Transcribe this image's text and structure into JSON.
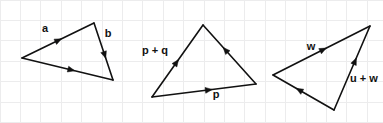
{
  "figure": {
    "width": 383,
    "height": 123,
    "background_color": "#ffffff",
    "grid": {
      "visible": true,
      "spacing": 20.4,
      "color": "#ececed",
      "line_width": 1,
      "origin_x": 0,
      "origin_y": 0
    },
    "stroke_color": "#111111",
    "stroke_width": 1.6,
    "arrow_size": 7
  },
  "diagrams": [
    {
      "id": "triangle-a-b",
      "name": "left-triangle",
      "vertices": [
        {
          "name": "left",
          "x": 22,
          "y": 58
        },
        {
          "name": "top",
          "x": 94,
          "y": 23
        },
        {
          "name": "right",
          "x": 113,
          "y": 80
        }
      ],
      "edges": [
        {
          "name": "edge-a",
          "from": {
            "x": 22,
            "y": 58
          },
          "to": {
            "x": 94,
            "y": 23
          },
          "arrow_at": 0.55,
          "arrow_direction": "forward"
        },
        {
          "name": "edge-b",
          "from": {
            "x": 94,
            "y": 23
          },
          "to": {
            "x": 113,
            "y": 80
          },
          "arrow_at": 0.62,
          "arrow_direction": "forward"
        },
        {
          "name": "edge-base",
          "from": {
            "x": 22,
            "y": 58
          },
          "to": {
            "x": 113,
            "y": 80
          },
          "arrow_at": 0.58,
          "arrow_direction": "forward"
        }
      ],
      "labels": [
        {
          "name": "label-a",
          "text": "a",
          "x": 45,
          "y": 29,
          "anchor": "middle"
        },
        {
          "name": "label-b",
          "text": "b",
          "x": 108,
          "y": 34,
          "anchor": "middle"
        }
      ]
    },
    {
      "id": "triangle-p-q",
      "name": "middle-triangle",
      "vertices": [
        {
          "name": "bottom-left",
          "x": 152,
          "y": 97
        },
        {
          "name": "apex",
          "x": 203,
          "y": 25
        },
        {
          "name": "right",
          "x": 256,
          "y": 84
        }
      ],
      "edges": [
        {
          "name": "edge-p-plus-q",
          "from": {
            "x": 152,
            "y": 97
          },
          "to": {
            "x": 203,
            "y": 25
          },
          "arrow_at": 0.52,
          "arrow_direction": "forward"
        },
        {
          "name": "edge-q",
          "from": {
            "x": 256,
            "y": 84
          },
          "to": {
            "x": 203,
            "y": 25
          },
          "arrow_at": 0.62,
          "arrow_direction": "forward"
        },
        {
          "name": "edge-p",
          "from": {
            "x": 152,
            "y": 97
          },
          "to": {
            "x": 256,
            "y": 84
          },
          "arrow_at": 0.58,
          "arrow_direction": "forward"
        }
      ],
      "labels": [
        {
          "name": "label-p-plus-q",
          "text": "p + q",
          "x": 155,
          "y": 51,
          "anchor": "middle"
        },
        {
          "name": "label-p",
          "text": "p",
          "x": 216,
          "y": 95,
          "anchor": "middle"
        }
      ]
    },
    {
      "id": "triangle-u-w",
      "name": "right-triangle",
      "vertices": [
        {
          "name": "left",
          "x": 273,
          "y": 75
        },
        {
          "name": "top-right",
          "x": 370,
          "y": 26
        },
        {
          "name": "bottom",
          "x": 334,
          "y": 110
        }
      ],
      "edges": [
        {
          "name": "edge-w",
          "from": {
            "x": 273,
            "y": 75
          },
          "to": {
            "x": 370,
            "y": 26
          },
          "arrow_at": 0.55,
          "arrow_direction": "forward"
        },
        {
          "name": "edge-u-plus-w",
          "from": {
            "x": 334,
            "y": 110
          },
          "to": {
            "x": 370,
            "y": 26
          },
          "arrow_at": 0.62,
          "arrow_direction": "forward"
        },
        {
          "name": "edge-u",
          "from": {
            "x": 334,
            "y": 110
          },
          "to": {
            "x": 273,
            "y": 75
          },
          "arrow_at": 0.62,
          "arrow_direction": "forward"
        }
      ],
      "labels": [
        {
          "name": "label-w",
          "text": "w",
          "x": 311,
          "y": 47,
          "anchor": "middle"
        },
        {
          "name": "label-u-plus-w",
          "text": "u + w",
          "x": 364,
          "y": 79,
          "anchor": "middle"
        }
      ]
    }
  ]
}
